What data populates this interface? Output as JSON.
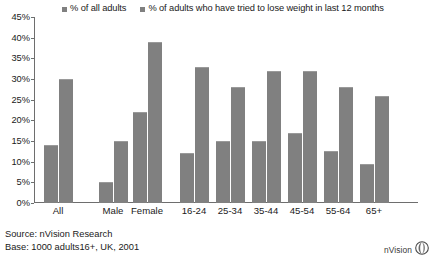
{
  "chart_data": {
    "type": "bar",
    "title": "",
    "xlabel": "",
    "ylabel": "",
    "ylim": [
      0,
      45
    ],
    "grid": false,
    "legend_position": "top",
    "categories": [
      "All",
      "Male",
      "Female",
      "16-24",
      "25-34",
      "35-44",
      "45-54",
      "55-64",
      "65+"
    ],
    "ytick_labels": [
      "45%",
      "40%",
      "35%",
      "30%",
      "25%",
      "20%",
      "15%",
      "10%",
      "5%",
      "0%"
    ],
    "ytick_values": [
      45,
      40,
      35,
      30,
      25,
      20,
      15,
      10,
      5,
      0
    ],
    "series": [
      {
        "name": "% of all adults",
        "color": "#808080",
        "values": [
          14,
          5,
          22,
          12,
          15,
          15,
          17,
          12.5,
          9.5
        ]
      },
      {
        "name": "% of adults who have tried to lose weight in last 12 months",
        "color": "#808080",
        "values": [
          30,
          15,
          39,
          33,
          28,
          32,
          32,
          28,
          26
        ]
      }
    ]
  },
  "legend": {
    "entries": [
      {
        "label": "% of all adults",
        "color": "#808080"
      },
      {
        "label": "% of adults who have tried to lose weight in last 12 months",
        "color": "#808080"
      }
    ]
  },
  "footer": {
    "source": "Source: nVision Research",
    "base": "Base: 1000 adults16+, UK, 2001"
  },
  "brand": {
    "name": "nVision",
    "mark": "nvision-leaf-logo"
  }
}
